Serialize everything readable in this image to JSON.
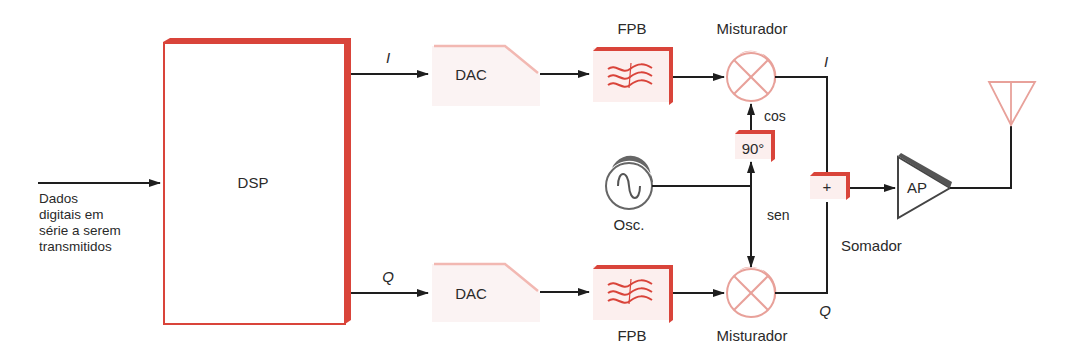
{
  "input": {
    "lines": [
      "Dados",
      "digitais em",
      "série a serem",
      "transmitidos"
    ]
  },
  "dsp": {
    "label": "DSP"
  },
  "channels": {
    "i": {
      "label": "I"
    },
    "q": {
      "label": "Q"
    }
  },
  "dac_top": {
    "label": "DAC"
  },
  "dac_bottom": {
    "label": "DAC"
  },
  "fpb_top": {
    "label": "FPB"
  },
  "fpb_bottom": {
    "label": "FPB"
  },
  "mixer_top": {
    "label": "Misturador"
  },
  "mixer_bottom": {
    "label": "Misturador"
  },
  "phase_shift": {
    "label": "90°",
    "out_label": "cos"
  },
  "oscillator": {
    "label": "Osc.",
    "out_label": "sen"
  },
  "summer": {
    "symbol": "+",
    "label": "Somador"
  },
  "amplifier": {
    "label": "AP"
  },
  "colors": {
    "accent": "#d9443a",
    "accent_light": "#f2b8b2",
    "mixer": "#e8a19a",
    "line": "#1e1e1e",
    "gray": "#666666"
  }
}
